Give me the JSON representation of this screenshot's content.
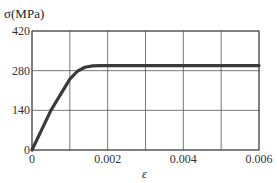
{
  "chart_data": {
    "type": "line",
    "title": "",
    "xlabel": "ε",
    "ylabel": "σ(MPa)",
    "xlim": [
      0,
      0.006
    ],
    "ylim": [
      0,
      420
    ],
    "x_ticks": [
      "0",
      "0.002",
      "0.004",
      "0.006"
    ],
    "y_ticks": [
      "0",
      "140",
      "280",
      "420"
    ],
    "grid": true,
    "x_grid_step": 0.001,
    "y_grid_step": 140,
    "legend": null,
    "series": [
      {
        "name": "stress-strain",
        "color": "#3a3a3a",
        "x": [
          0,
          0.0005,
          0.001,
          0.0012,
          0.0014,
          0.0016,
          0.0018,
          0.002,
          0.003,
          0.004,
          0.005,
          0.006
        ],
        "y": [
          0,
          140,
          250,
          278,
          292,
          297,
          298,
          298,
          298,
          298,
          298,
          298
        ]
      }
    ]
  }
}
